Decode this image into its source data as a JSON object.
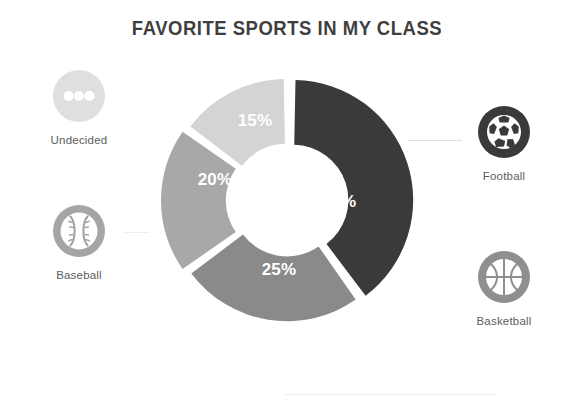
{
  "title": "FAVORITE SPORTS IN MY CLASS",
  "colors": {
    "football": "#3a3a3a",
    "basketball": "#8a8a8a",
    "baseball": "#a8a8a8",
    "undecided": "#d4d4d4",
    "title_text": "#3f3f3f",
    "label_text": "#5c5c5c",
    "slice_label_text": "#ffffff",
    "background": "#ffffff",
    "connector": "#e2e2e2"
  },
  "legend": {
    "undecided": {
      "label": "Undecided",
      "icon": "ellipsis-circle-icon",
      "color": "#d4d4d4",
      "percent": "15%"
    },
    "baseball": {
      "label": "Baseball",
      "icon": "baseball-icon",
      "color": "#a8a8a8",
      "percent": "20%"
    },
    "football": {
      "label": "Football",
      "icon": "soccer-ball-icon",
      "color": "#3a3a3a",
      "percent": "40%"
    },
    "basketball": {
      "label": "Basketball",
      "icon": "basketball-icon",
      "color": "#8a8a8a",
      "percent": "25%"
    }
  },
  "slices": {
    "football": {
      "label": "40%"
    },
    "basketball": {
      "label": "25%"
    },
    "baseball": {
      "label": "20%"
    },
    "undecided": {
      "label": "15%"
    }
  },
  "chart_data": {
    "type": "pie",
    "variant": "donut",
    "title": "FAVORITE SPORTS IN MY CLASS",
    "xlabel": "",
    "ylabel": "",
    "categories": [
      "Football",
      "Basketball",
      "Baseball",
      "Undecided"
    ],
    "values": [
      40,
      25,
      20,
      15
    ],
    "value_labels": [
      "40%",
      "25%",
      "20%",
      "15%"
    ],
    "unit": "percent",
    "total": 100,
    "colors": [
      "#3a3a3a",
      "#8a8a8a",
      "#a8a8a8",
      "#d4d4d4"
    ],
    "start_angle_deg": 0,
    "direction": "clockwise",
    "exploded": [
      "Football",
      "Baseball"
    ],
    "inner_radius_ratio": 0.46,
    "legend": true,
    "legend_position": "sides",
    "grid": false,
    "annotations": []
  }
}
